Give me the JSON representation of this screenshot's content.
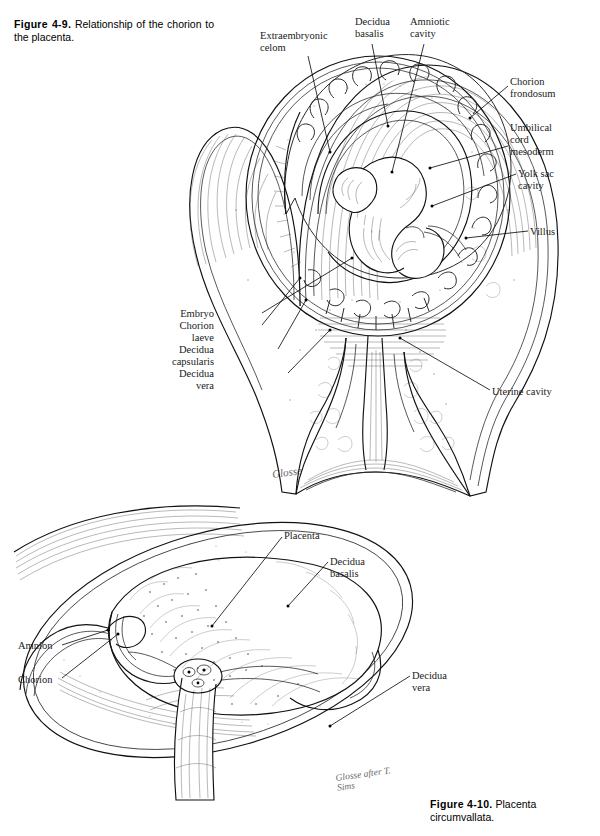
{
  "page": {
    "background": "#ffffff",
    "ink": "#111111"
  },
  "figures": [
    {
      "id": "figure-4-9",
      "caption_number": "Figure 4-9.",
      "caption_text": "Relationship of the chorion to the placenta.",
      "signature": "Glosse",
      "labels": [
        {
          "key": "extraembryonic-celom",
          "text": "Extraembryonic\ncelom",
          "x": 260,
          "y": 30,
          "align": "left",
          "lead": [
            [
              308,
              56
            ],
            [
              330,
              152
            ]
          ]
        },
        {
          "key": "decidua-basalis",
          "text": "Decidua\nbasalis",
          "x": 355,
          "y": 16,
          "align": "left",
          "lead": [
            [
              372,
              44
            ],
            [
              388,
              126
            ]
          ]
        },
        {
          "key": "amniotic-cavity",
          "text": "Amniotic\ncavity",
          "x": 410,
          "y": 16,
          "align": "left",
          "lead": [
            [
              424,
              44
            ],
            [
              392,
              172
            ]
          ]
        },
        {
          "key": "chorion-frondosum",
          "text": "Chorion\nfrondosum",
          "x": 510,
          "y": 76,
          "align": "left",
          "lead": [
            [
              508,
              86
            ],
            [
              470,
              118
            ]
          ]
        },
        {
          "key": "umbilical-cord-mesoderm",
          "text": "Umbilical\ncord\nmesoderm",
          "x": 510,
          "y": 122,
          "align": "left",
          "lead": [
            [
              508,
              146
            ],
            [
              430,
              168
            ]
          ]
        },
        {
          "key": "yolk-sac-cavity",
          "text": "Yolk sac\ncavity",
          "x": 518,
          "y": 168,
          "align": "left",
          "lead": [
            [
              516,
              174
            ],
            [
              432,
              206
            ]
          ]
        },
        {
          "key": "villus",
          "text": "Villus",
          "x": 530,
          "y": 226,
          "align": "left",
          "lead": [
            [
              528,
              231
            ],
            [
              466,
              238
            ]
          ]
        },
        {
          "key": "embryo",
          "text": "Embryo",
          "x": 214,
          "y": 308,
          "align": "right",
          "lead": [
            [
              262,
              313
            ],
            [
              352,
              258
            ]
          ]
        },
        {
          "key": "chorion-laeve",
          "text": "Chorion\nlaeve",
          "x": 214,
          "y": 320,
          "align": "right",
          "lead": [
            [
              262,
              325
            ],
            [
              300,
              278
            ]
          ]
        },
        {
          "key": "decidua-capsularis",
          "text": "Decidua\ncapsularis",
          "x": 214,
          "y": 344,
          "align": "right",
          "lead": [
            [
              278,
              349
            ],
            [
              306,
              300
            ]
          ]
        },
        {
          "key": "decidua-vera",
          "text": "Decidua\nvera",
          "x": 214,
          "y": 368,
          "align": "right",
          "lead": [
            [
              288,
              373
            ],
            [
              330,
              330
            ]
          ]
        },
        {
          "key": "uterine-cavity",
          "text": "Uterine cavity",
          "x": 492,
          "y": 386,
          "align": "left",
          "lead": [
            [
              490,
              390
            ],
            [
              400,
              338
            ]
          ]
        }
      ]
    },
    {
      "id": "figure-4-10",
      "caption_number": "Figure 4-10.",
      "caption_text": "Placenta circumvallata.",
      "signature": "Glosse after T. Sims",
      "labels": [
        {
          "key": "placenta",
          "text": "Placenta",
          "x": 284,
          "y": 530,
          "align": "left",
          "lead": [
            [
              282,
              537
            ],
            [
              212,
              626
            ]
          ]
        },
        {
          "key": "decidua-basalis",
          "text": "Decidua\nbasalis",
          "x": 330,
          "y": 556,
          "align": "left",
          "lead": [
            [
              328,
              562
            ],
            [
              288,
              606
            ]
          ]
        },
        {
          "key": "amnion",
          "text": "Amnion",
          "x": 18,
          "y": 640,
          "align": "left",
          "lead": [
            [
              62,
              645
            ],
            [
              108,
              630
            ]
          ]
        },
        {
          "key": "chorion",
          "text": "Chorion",
          "x": 18,
          "y": 674,
          "align": "left",
          "lead": [
            [
              62,
              678
            ],
            [
              118,
              634
            ]
          ]
        },
        {
          "key": "decidua-vera",
          "text": "Decidua\nvera",
          "x": 412,
          "y": 670,
          "align": "left",
          "lead": [
            [
              410,
              676
            ],
            [
              330,
              726
            ]
          ]
        }
      ]
    }
  ]
}
